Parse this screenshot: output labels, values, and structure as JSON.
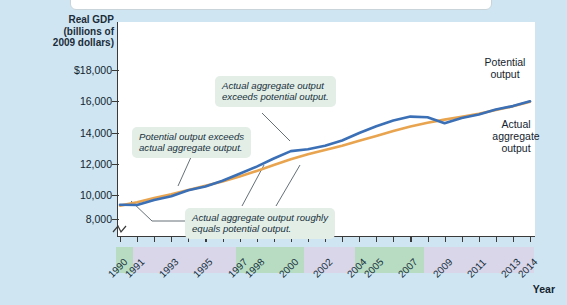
{
  "axes": {
    "y_title_lines": [
      "Real GDP",
      "(billions of",
      "2009 dollars)"
    ],
    "x_title": "Year",
    "y_ticks": [
      "$18,000",
      "16,000",
      "14,000",
      "12,000",
      "10,000",
      "8,000"
    ],
    "x_tick_labels": [
      "1990",
      "1991",
      "1993",
      "1995",
      "1997",
      "1998",
      "2000",
      "2002",
      "2004",
      "2005",
      "2007",
      "2009",
      "2011",
      "2013",
      "2014"
    ]
  },
  "annotations": {
    "potential_exceeds": "Potential output exceeds\nactual aggregate output.",
    "potential_exceeds_l1": "Potential output exceeds",
    "potential_exceeds_l2": "actual aggregate output.",
    "actual_exceeds_l1": "Actual aggregate output",
    "actual_exceeds_l2": "exceeds potential output.",
    "roughly_equal_l1": "Actual aggregate output roughly",
    "roughly_equal_l2": "equals potential output."
  },
  "series_labels": {
    "potential_l1": "Potential",
    "potential_l2": "output",
    "actual_l1": "Actual",
    "actual_l2": "aggregate",
    "actual_l3": "output"
  },
  "colors": {
    "potential": "#E9A44F",
    "actual": "#3B6FB6",
    "background": "#cfe6f2",
    "plot": "#ffffff",
    "callout": "#e3eee6",
    "band_purple": "#d8d6e8",
    "band_green": "#b7dcc2"
  },
  "chart_data": {
    "type": "line",
    "title": "",
    "xlabel": "Year",
    "ylabel": "Real GDP (billions of 2009 dollars)",
    "ylim": [
      8000,
      18500
    ],
    "xlim": [
      1990,
      2014
    ],
    "grid": false,
    "legend": "inline-right",
    "x": [
      1990,
      1991,
      1992,
      1993,
      1994,
      1995,
      1996,
      1997,
      1998,
      1999,
      2000,
      2001,
      2002,
      2003,
      2004,
      2005,
      2006,
      2007,
      2008,
      2009,
      2010,
      2011,
      2012,
      2013,
      2014
    ],
    "series": [
      {
        "name": "Potential output",
        "color": "#E9A44F",
        "values": [
          8900,
          9130,
          9400,
          9660,
          9950,
          10230,
          10520,
          10860,
          11230,
          11620,
          12010,
          12350,
          12630,
          12920,
          13250,
          13580,
          13900,
          14200,
          14460,
          14670,
          14860,
          15070,
          15310,
          15570,
          15870
        ]
      },
      {
        "name": "Actual aggregate output",
        "color": "#3B6FB6",
        "values": [
          8950,
          8940,
          9270,
          9530,
          9930,
          10190,
          10570,
          11040,
          11520,
          12060,
          12560,
          12680,
          12910,
          13270,
          13770,
          14230,
          14610,
          14870,
          14830,
          14420,
          14780,
          15020,
          15350,
          15580,
          15900
        ]
      }
    ],
    "annotations": [
      {
        "text": "Potential output exceeds actual aggregate output.",
        "points_to_year": 1993
      },
      {
        "text": "Actual aggregate output exceeds potential output.",
        "points_to_year": 2000
      },
      {
        "text": "Actual aggregate output roughly equals potential output.",
        "points_to_year": 1991
      }
    ],
    "year_bands": [
      {
        "start": 1990,
        "end": 1991,
        "color": "#b7dcc2"
      },
      {
        "start": 1991,
        "end": 1997,
        "color": "#d8d6e8"
      },
      {
        "start": 1997,
        "end": 2001,
        "color": "#b7dcc2"
      },
      {
        "start": 2001,
        "end": 2004,
        "color": "#d8d6e8"
      },
      {
        "start": 2004,
        "end": 2008,
        "color": "#b7dcc2"
      },
      {
        "start": 2008,
        "end": 2014,
        "color": "#d8d6e8"
      }
    ]
  }
}
